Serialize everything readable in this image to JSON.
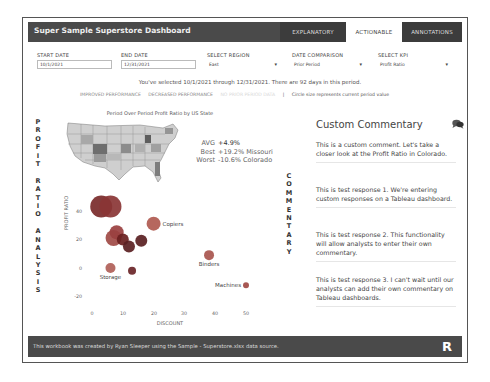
{
  "header": {
    "title": "Super Sample Superstore Dashboard",
    "tabs": [
      {
        "label": "EXPLANATORY",
        "state": "inactive"
      },
      {
        "label": "ACTIONABLE",
        "state": "active"
      },
      {
        "label": "ANNOTATIONS",
        "state": "inactive"
      }
    ]
  },
  "filters": {
    "start_date": {
      "label": "START DATE",
      "value": "10/1/2021"
    },
    "end_date": {
      "label": "END DATE",
      "value": "12/31/2021"
    },
    "region": {
      "label": "SELECT REGION",
      "value": "East"
    },
    "date_comparison": {
      "label": "DATE COMPARISON",
      "value": "Prior Period"
    },
    "kpi": {
      "label": "SELECT KPI",
      "value": "Profit Ratio"
    }
  },
  "period_text": "You've selected 10/1/2021 through 12/31/2021. There are 92 days in this period.",
  "legend": {
    "improved": "IMPROVED PERFORMANCE",
    "decreased": "DECREASED PERFORMANCE",
    "no_data": "NO PRIOR PERIOD DATA",
    "separator": "|",
    "note": "Circle size represents current period value"
  },
  "side_label_left": [
    "P",
    "R",
    "O",
    "F",
    "I",
    "T",
    " ",
    "R",
    "A",
    "T",
    "I",
    "O",
    " ",
    "A",
    "N",
    "A",
    "L",
    "Y",
    "S",
    "I",
    "S"
  ],
  "side_label_right": [
    "C",
    "O",
    "M",
    "M",
    "E",
    "N",
    "T",
    "A",
    "R",
    "Y"
  ],
  "map": {
    "title": "Period Over Period Profit Ratio by US State",
    "avg_label": "AVG",
    "avg_value": "+4.9%",
    "best_label": "Best",
    "best_value": "+19.2% Missouri",
    "worst_label": "Worst",
    "worst_value": "-10.6% Colorado"
  },
  "chart_data": {
    "type": "scatter",
    "title": "",
    "xlabel": "DISCOUNT",
    "ylabel": "PROFIT RATIO",
    "xlim": [
      0,
      50
    ],
    "ylim": [
      -20,
      45
    ],
    "x_ticks": [
      0,
      10,
      20,
      30,
      40,
      50
    ],
    "y_ticks": [
      -20,
      0,
      20,
      40
    ],
    "points": [
      {
        "label": "",
        "x": 3,
        "y": 43,
        "size": 11,
        "color": "#7a2a2a"
      },
      {
        "label": "",
        "x": 6,
        "y": 43,
        "size": 11,
        "color": "#8a3535"
      },
      {
        "label": "Copiers",
        "x": 20,
        "y": 31,
        "size": 7,
        "color": "#b05a50"
      },
      {
        "label": "",
        "x": 7,
        "y": 21,
        "size": 8,
        "color": "#a04a45"
      },
      {
        "label": "",
        "x": 8,
        "y": 25,
        "size": 7,
        "color": "#9a4040"
      },
      {
        "label": "",
        "x": 10,
        "y": 20,
        "size": 6,
        "color": "#6a2020"
      },
      {
        "label": "",
        "x": 12,
        "y": 15,
        "size": 6,
        "color": "#5a1f22"
      },
      {
        "label": "",
        "x": 16,
        "y": 19,
        "size": 6,
        "color": "#5a1f22"
      },
      {
        "label": "Storage",
        "x": 6,
        "y": 0,
        "size": 5,
        "color": "#b06058"
      },
      {
        "label": "",
        "x": 13,
        "y": -2,
        "size": 4,
        "color": "#6a2528"
      },
      {
        "label": "Binders",
        "x": 38,
        "y": 9,
        "size": 5,
        "color": "#a8554e"
      },
      {
        "label": "Machines",
        "x": 50,
        "y": -12,
        "size": 3,
        "color": "#a04a45"
      }
    ]
  },
  "commentary": {
    "title": "Custom Commentary",
    "icon": "chat-bubbles-icon",
    "items": [
      "This is a custom comment. Let's take a closer look at the Profit Ratio in Colorado.",
      "This is test response 1. We're entering custom responses on a Tableau dashboard.",
      "This is test response 2. This functionality will allow analysts to enter their own commentary.",
      "This is test response 3. I can't wait until our analysts can add their own commentary on Tableau dashboards."
    ]
  },
  "footer": {
    "text": "This workbook was created by Ryan Sleeper using the Sample - Superstore.xlsx data source.",
    "logo": "R"
  }
}
